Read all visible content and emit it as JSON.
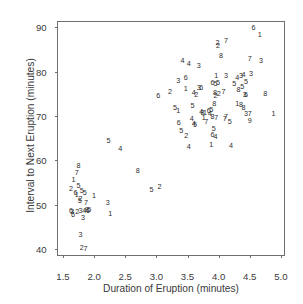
{
  "chart_data": {
    "type": "scatter",
    "title": "",
    "xlabel": "Duration of Eruption (minutes)",
    "ylabel": "Interval to Next Eruption (minutes)",
    "xlim": [
      1.42,
      5.05
    ],
    "ylim": [
      38.6,
      91.2
    ],
    "xticks": [
      1.5,
      2.0,
      2.5,
      3.0,
      3.5,
      4.0,
      4.5,
      5.0
    ],
    "xtick_labels": [
      "1.5",
      "2.0",
      "2.5",
      "3.0",
      "3.5",
      "4.0",
      "4.5",
      "5.0"
    ],
    "yticks": [
      40,
      50,
      60,
      70,
      80,
      90
    ],
    "ytick_labels": [
      "40",
      "50",
      "60",
      "70",
      "80",
      "90"
    ],
    "grid": false,
    "legend": false,
    "marker_style": "text-digit",
    "marker_note": "Each point is plotted as a digit 1-8 denoting the coded group/day of the observation",
    "point_color": "#2b2b2b",
    "axis_color": "#6f6f6f",
    "text_color": "#3a3a3a",
    "points": [
      {
        "x": 1.63,
        "y": 53.5,
        "label": "2"
      },
      {
        "x": 1.67,
        "y": 55.5,
        "label": "1"
      },
      {
        "x": 1.72,
        "y": 57.0,
        "label": "7"
      },
      {
        "x": 1.75,
        "y": 58.8,
        "label": "8"
      },
      {
        "x": 1.75,
        "y": 54.2,
        "label": "5"
      },
      {
        "x": 1.7,
        "y": 52.7,
        "label": "6"
      },
      {
        "x": 1.72,
        "y": 52.2,
        "label": "1"
      },
      {
        "x": 1.8,
        "y": 53.1,
        "label": "5"
      },
      {
        "x": 1.78,
        "y": 51.2,
        "label": "2"
      },
      {
        "x": 1.77,
        "y": 50.7,
        "label": "5"
      },
      {
        "x": 1.85,
        "y": 52.6,
        "label": "5"
      },
      {
        "x": 1.87,
        "y": 50.4,
        "label": "7"
      },
      {
        "x": 1.63,
        "y": 48.5,
        "label": "6"
      },
      {
        "x": 1.65,
        "y": 48.2,
        "label": "3"
      },
      {
        "x": 1.66,
        "y": 47.6,
        "label": "6"
      },
      {
        "x": 1.73,
        "y": 48.4,
        "label": "2"
      },
      {
        "x": 1.78,
        "y": 48.5,
        "label": "3"
      },
      {
        "x": 1.84,
        "y": 48.6,
        "label": "4"
      },
      {
        "x": 1.88,
        "y": 48.7,
        "label": "8"
      },
      {
        "x": 1.9,
        "y": 48.6,
        "label": "6"
      },
      {
        "x": 1.92,
        "y": 48.8,
        "label": "5"
      },
      {
        "x": 1.82,
        "y": 46.9,
        "label": "3"
      },
      {
        "x": 1.78,
        "y": 43.2,
        "label": "3"
      },
      {
        "x": 1.8,
        "y": 40.1,
        "label": "2"
      },
      {
        "x": 1.86,
        "y": 40.0,
        "label": "7"
      },
      {
        "x": 2.0,
        "y": 52.0,
        "label": "1"
      },
      {
        "x": 2.22,
        "y": 50.4,
        "label": "3"
      },
      {
        "x": 2.26,
        "y": 47.8,
        "label": "1"
      },
      {
        "x": 2.23,
        "y": 64.4,
        "label": "5"
      },
      {
        "x": 2.42,
        "y": 62.6,
        "label": "4"
      },
      {
        "x": 2.7,
        "y": 57.6,
        "label": "8"
      },
      {
        "x": 2.92,
        "y": 53.3,
        "label": "5"
      },
      {
        "x": 3.05,
        "y": 54.0,
        "label": "2"
      },
      {
        "x": 3.03,
        "y": 74.6,
        "label": "6"
      },
      {
        "x": 3.22,
        "y": 75.5,
        "label": "2"
      },
      {
        "x": 3.3,
        "y": 71.8,
        "label": "5"
      },
      {
        "x": 3.35,
        "y": 71.2,
        "label": "1"
      },
      {
        "x": 3.35,
        "y": 77.8,
        "label": "3"
      },
      {
        "x": 3.42,
        "y": 82.5,
        "label": "4"
      },
      {
        "x": 3.52,
        "y": 81.8,
        "label": "4"
      },
      {
        "x": 3.47,
        "y": 78.5,
        "label": "6"
      },
      {
        "x": 3.47,
        "y": 76.0,
        "label": "1"
      },
      {
        "x": 3.36,
        "y": 68.4,
        "label": "6"
      },
      {
        "x": 3.4,
        "y": 66.7,
        "label": "5"
      },
      {
        "x": 3.48,
        "y": 65.4,
        "label": "2"
      },
      {
        "x": 3.52,
        "y": 63.0,
        "label": "4"
      },
      {
        "x": 3.6,
        "y": 75.1,
        "label": "4"
      },
      {
        "x": 3.58,
        "y": 72.3,
        "label": "5"
      },
      {
        "x": 3.57,
        "y": 69.3,
        "label": "4"
      },
      {
        "x": 3.62,
        "y": 68.0,
        "label": "5"
      },
      {
        "x": 3.6,
        "y": 68.2,
        "label": "4"
      },
      {
        "x": 3.68,
        "y": 81.2,
        "label": "3"
      },
      {
        "x": 3.68,
        "y": 76.4,
        "label": "3"
      },
      {
        "x": 3.72,
        "y": 76.3,
        "label": "6"
      },
      {
        "x": 3.64,
        "y": 74.8,
        "label": "2"
      },
      {
        "x": 3.72,
        "y": 70.8,
        "label": "4"
      },
      {
        "x": 3.78,
        "y": 70.6,
        "label": "1"
      },
      {
        "x": 3.74,
        "y": 70.7,
        "label": "8"
      },
      {
        "x": 3.76,
        "y": 69.5,
        "label": "1"
      },
      {
        "x": 3.8,
        "y": 68.6,
        "label": "7"
      },
      {
        "x": 3.84,
        "y": 71.0,
        "label": "6"
      },
      {
        "x": 3.9,
        "y": 77.5,
        "label": "6"
      },
      {
        "x": 3.96,
        "y": 78.9,
        "label": "1"
      },
      {
        "x": 3.95,
        "y": 77.3,
        "label": "5"
      },
      {
        "x": 3.99,
        "y": 77.4,
        "label": "5"
      },
      {
        "x": 3.94,
        "y": 75.2,
        "label": "8"
      },
      {
        "x": 4.0,
        "y": 75.0,
        "label": "2"
      },
      {
        "x": 3.95,
        "y": 74.5,
        "label": "2"
      },
      {
        "x": 3.93,
        "y": 72.6,
        "label": "8"
      },
      {
        "x": 3.88,
        "y": 71.4,
        "label": "5"
      },
      {
        "x": 3.86,
        "y": 70.5,
        "label": "4"
      },
      {
        "x": 3.9,
        "y": 69.8,
        "label": "8"
      },
      {
        "x": 3.96,
        "y": 69.5,
        "label": "7"
      },
      {
        "x": 3.92,
        "y": 67.0,
        "label": "5"
      },
      {
        "x": 3.9,
        "y": 65.6,
        "label": "6"
      },
      {
        "x": 3.95,
        "y": 65.2,
        "label": "4"
      },
      {
        "x": 3.88,
        "y": 63.4,
        "label": "1"
      },
      {
        "x": 3.99,
        "y": 85.8,
        "label": "2"
      },
      {
        "x": 3.98,
        "y": 86.4,
        "label": "2"
      },
      {
        "x": 4.04,
        "y": 83.5,
        "label": "8"
      },
      {
        "x": 4.12,
        "y": 87.0,
        "label": "7"
      },
      {
        "x": 4.12,
        "y": 79.0,
        "label": "3"
      },
      {
        "x": 4.08,
        "y": 75.4,
        "label": "7"
      },
      {
        "x": 4.12,
        "y": 69.8,
        "label": "7"
      },
      {
        "x": 4.1,
        "y": 69.4,
        "label": "7"
      },
      {
        "x": 4.18,
        "y": 68.6,
        "label": "5"
      },
      {
        "x": 4.2,
        "y": 63.2,
        "label": "4"
      },
      {
        "x": 4.25,
        "y": 77.2,
        "label": "5"
      },
      {
        "x": 4.3,
        "y": 78.6,
        "label": "4"
      },
      {
        "x": 4.32,
        "y": 75.8,
        "label": "8"
      },
      {
        "x": 4.36,
        "y": 79.1,
        "label": "3"
      },
      {
        "x": 4.3,
        "y": 72.6,
        "label": "1"
      },
      {
        "x": 4.36,
        "y": 72.5,
        "label": "8"
      },
      {
        "x": 4.38,
        "y": 76.6,
        "label": "5"
      },
      {
        "x": 4.4,
        "y": 79.2,
        "label": "4"
      },
      {
        "x": 4.44,
        "y": 77.6,
        "label": "5"
      },
      {
        "x": 4.42,
        "y": 74.7,
        "label": "3"
      },
      {
        "x": 4.44,
        "y": 74.8,
        "label": "6"
      },
      {
        "x": 4.4,
        "y": 71.8,
        "label": "8"
      },
      {
        "x": 4.44,
        "y": 70.5,
        "label": "3"
      },
      {
        "x": 4.5,
        "y": 70.4,
        "label": "7"
      },
      {
        "x": 4.5,
        "y": 68.8,
        "label": "9"
      },
      {
        "x": 4.5,
        "y": 82.8,
        "label": "7"
      },
      {
        "x": 4.56,
        "y": 89.8,
        "label": "6"
      },
      {
        "x": 4.52,
        "y": 79.4,
        "label": "3"
      },
      {
        "x": 4.66,
        "y": 88.2,
        "label": "1"
      },
      {
        "x": 4.68,
        "y": 82.5,
        "label": "3"
      },
      {
        "x": 4.75,
        "y": 74.9,
        "label": "8"
      },
      {
        "x": 4.88,
        "y": 70.4,
        "label": "1"
      }
    ]
  }
}
